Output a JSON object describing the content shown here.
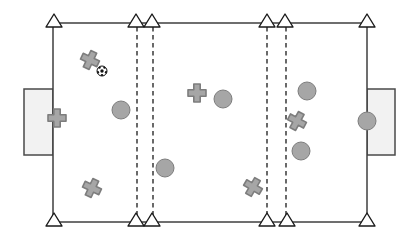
{
  "diagram": {
    "name": "soccer-drill-field-diagram",
    "canvas": {
      "width": 415,
      "height": 241,
      "background": "#ffffff"
    },
    "colors": {
      "field_line": "#3f3f3f",
      "dashed_line": "#2b2b2b",
      "cone_fill": "#ffffff",
      "cone_stroke": "#1a1a1a",
      "goal_fill": "#f2f2f2",
      "goal_stroke": "#4a4a4a",
      "player_fill": "#a6a6a6",
      "player_stroke": "#7d7d7d",
      "ball_fill": "#ffffff",
      "ball_stroke": "#111111",
      "ball_patch": "#111111"
    },
    "field": {
      "x": 53,
      "y": 23,
      "width": 314,
      "height": 199
    },
    "goals": [
      {
        "id": "goal-left",
        "x": 24,
        "y": 89,
        "width": 29,
        "height": 66
      },
      {
        "id": "goal-right",
        "x": 367,
        "y": 89,
        "width": 28,
        "height": 66
      }
    ],
    "zone_lines": [
      {
        "x": 137,
        "y1": 27,
        "y2": 216
      },
      {
        "x": 153,
        "y1": 27,
        "y2": 216
      },
      {
        "x": 267,
        "y1": 27,
        "y2": 216
      },
      {
        "x": 286,
        "y1": 27,
        "y2": 216
      }
    ],
    "cones": {
      "size": {
        "half_width": 8,
        "tip_rise": 9,
        "base_drop": 4
      },
      "top_line_y": 23,
      "bottom_line_y": 222,
      "top_x": [
        54,
        136,
        152,
        267,
        285,
        367
      ],
      "bottom_x": [
        54,
        136,
        152,
        267,
        287,
        367
      ]
    },
    "players_cross": {
      "half_size": 9,
      "arm_half_thickness": 3.2,
      "items": [
        {
          "x": 90,
          "y": 60,
          "rotation": 25
        },
        {
          "x": 57,
          "y": 118,
          "rotation": 0
        },
        {
          "x": 92,
          "y": 188,
          "rotation": 25
        },
        {
          "x": 197,
          "y": 93,
          "rotation": 0
        },
        {
          "x": 253,
          "y": 187,
          "rotation": 30
        },
        {
          "x": 297,
          "y": 121,
          "rotation": 28
        }
      ]
    },
    "players_circle": {
      "radius": 9,
      "items": [
        {
          "x": 121,
          "y": 110
        },
        {
          "x": 223,
          "y": 99
        },
        {
          "x": 165,
          "y": 168
        },
        {
          "x": 307,
          "y": 91
        },
        {
          "x": 301,
          "y": 151
        },
        {
          "x": 367,
          "y": 121
        }
      ]
    },
    "ball": {
      "x": 102,
      "y": 71,
      "radius": 5
    }
  }
}
